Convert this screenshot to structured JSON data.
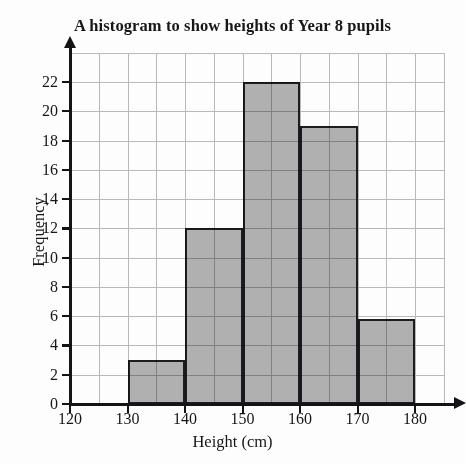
{
  "chart_data": {
    "type": "bar",
    "title": "A histogram to show heights of Year 8 pupils",
    "xlabel": "Height (cm)",
    "ylabel": "Frequency",
    "xlim": [
      120,
      180
    ],
    "ylim": [
      0,
      22
    ],
    "xticks": [
      120,
      130,
      140,
      150,
      160,
      170,
      180
    ],
    "yticks": [
      0,
      2,
      4,
      6,
      8,
      10,
      12,
      14,
      16,
      18,
      20,
      22
    ],
    "x_minor_step": 5,
    "y_minor_step": 2,
    "grid": true,
    "legend": null,
    "bin_width": 10,
    "bin_edges": [
      120,
      130,
      140,
      150,
      160,
      170,
      180
    ],
    "categories": [
      "120-130",
      "130-140",
      "140-150",
      "150-160",
      "160-170",
      "170-180"
    ],
    "values": [
      0,
      3,
      12,
      22,
      19,
      5.8
    ],
    "bar_color": "#b2b2b2",
    "bar_edge_color": "#1d1d1f",
    "grid_color": "#b9b9bb",
    "axis_color": "#141416",
    "bars": [
      {
        "label": "120-130",
        "x0": 120,
        "x1": 130,
        "value": 0
      },
      {
        "label": "130-140",
        "x0": 130,
        "x1": 140,
        "value": 3
      },
      {
        "label": "140-150",
        "x0": 140,
        "x1": 150,
        "value": 12
      },
      {
        "label": "150-160",
        "x0": 150,
        "x1": 160,
        "value": 22
      },
      {
        "label": "160-170",
        "x0": 160,
        "x1": 170,
        "value": 19
      },
      {
        "label": "170-180",
        "x0": 170,
        "x1": 180,
        "value": 5.8
      }
    ]
  }
}
